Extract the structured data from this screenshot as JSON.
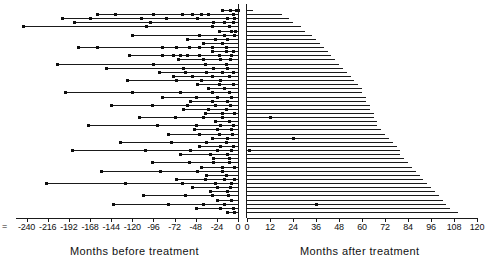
{
  "axes": {
    "left": {
      "title": "Months before treatment",
      "ticks": [
        -240,
        -216,
        -192,
        -168,
        -144,
        -120,
        -96,
        -72,
        -48,
        -24,
        0
      ],
      "tick_labels": [
        "-240",
        "-216",
        "-192",
        "-168",
        "-144",
        "-120",
        "-96",
        "-72",
        "-48",
        "-24",
        "0"
      ],
      "range": [
        -252,
        0
      ],
      "prefix_mark": "="
    },
    "right": {
      "title": "Months after treatment",
      "ticks": [
        0,
        12,
        24,
        36,
        48,
        60,
        72,
        84,
        96,
        108,
        120
      ],
      "tick_labels": [
        "0",
        "12",
        "24",
        "36",
        "48",
        "60",
        "72",
        "84",
        "96",
        "108",
        "120"
      ],
      "range": [
        0,
        120
      ]
    }
  },
  "style": {
    "line_color": "#1a1a1a",
    "marker_color": "#0d0d0d",
    "background": "#ffffff"
  },
  "chart_data": {
    "type": "scatter",
    "title": "",
    "xlabel": "Months before treatment / Months after treatment",
    "ylabel": "",
    "grid": false,
    "legend": null,
    "left_xlim": [
      -252,
      0
    ],
    "right_xlim": [
      0,
      120
    ],
    "n_rows": 50,
    "rows": [
      {
        "start": -18,
        "events": [
          -18,
          -9,
          -2,
          0
        ],
        "after": 3,
        "after_events": []
      },
      {
        "start": -160,
        "events": [
          -160,
          -140,
          -96,
          -64,
          -52,
          -42,
          -34,
          -6
        ],
        "after": 18,
        "after_events": []
      },
      {
        "start": -200,
        "events": [
          -200,
          -168,
          -110,
          -82,
          -46,
          -12,
          -4
        ],
        "after": 22,
        "after_events": []
      },
      {
        "start": -186,
        "events": [
          -186,
          -100,
          -28,
          -16,
          -6
        ],
        "after": 24,
        "after_events": []
      },
      {
        "start": -244,
        "events": [
          -244,
          -104,
          -30,
          -10
        ],
        "after": 28,
        "after_events": []
      },
      {
        "start": -22,
        "events": [
          -22,
          -8,
          -3
        ],
        "after": 30,
        "after_events": []
      },
      {
        "start": -120,
        "events": [
          -120,
          -44,
          -16,
          -5
        ],
        "after": 34,
        "after_events": []
      },
      {
        "start": -58,
        "events": [
          -58,
          -26,
          -12
        ],
        "after": 36,
        "after_events": []
      },
      {
        "start": -40,
        "events": [
          -40,
          -18
        ],
        "after": 38,
        "after_events": []
      },
      {
        "start": -182,
        "events": [
          -182,
          -160,
          -86,
          -70,
          -56,
          -44,
          -30,
          -14
        ],
        "after": 40,
        "after_events": []
      },
      {
        "start": -30,
        "events": [
          -30,
          -14,
          -6
        ],
        "after": 42,
        "after_events": []
      },
      {
        "start": -124,
        "events": [
          -124,
          -86,
          -74,
          -66,
          -58,
          -44,
          -22,
          -8
        ],
        "after": 44,
        "after_events": []
      },
      {
        "start": -68,
        "events": [
          -68,
          -40,
          -20,
          -9
        ],
        "after": 46,
        "after_events": []
      },
      {
        "start": -206,
        "events": [
          -206,
          -96,
          -38,
          -14
        ],
        "after": 48,
        "after_events": []
      },
      {
        "start": -150,
        "events": [
          -150,
          -62,
          -28,
          -12
        ],
        "after": 50,
        "after_events": []
      },
      {
        "start": -90,
        "events": [
          -90,
          -60,
          -36,
          -18,
          -6
        ],
        "after": 52,
        "after_events": []
      },
      {
        "start": -74,
        "events": [
          -74,
          -52,
          -30,
          -10
        ],
        "after": 54,
        "after_events": []
      },
      {
        "start": -126,
        "events": [
          -126,
          -70,
          -42,
          -20
        ],
        "after": 56,
        "after_events": []
      },
      {
        "start": -46,
        "events": [
          -46,
          -22,
          -6
        ],
        "after": 58,
        "after_events": []
      },
      {
        "start": -34,
        "events": [
          -34,
          -16
        ],
        "after": 60,
        "after_events": []
      },
      {
        "start": -196,
        "events": [
          -196,
          -120,
          -66,
          -30,
          -10
        ],
        "after": 60,
        "after_events": []
      },
      {
        "start": -86,
        "events": [
          -86,
          -48,
          -24,
          -8
        ],
        "after": 62,
        "after_events": []
      },
      {
        "start": -54,
        "events": [
          -54,
          -30,
          -12
        ],
        "after": 62,
        "after_events": []
      },
      {
        "start": -144,
        "events": [
          -144,
          -98,
          -58,
          -26,
          -9
        ],
        "after": 64,
        "after_events": []
      },
      {
        "start": -62,
        "events": [
          -62,
          -34,
          -14
        ],
        "after": 64,
        "after_events": []
      },
      {
        "start": -38,
        "events": [
          -38,
          -18,
          -5
        ],
        "after": 66,
        "after_events": []
      },
      {
        "start": -112,
        "events": [
          -112,
          -72,
          -40,
          -18
        ],
        "after": 66,
        "after_events": [
          12
        ]
      },
      {
        "start": -26,
        "events": [
          -26,
          -10
        ],
        "after": 68,
        "after_events": []
      },
      {
        "start": -170,
        "events": [
          -170,
          -92,
          -48,
          -20,
          -6
        ],
        "after": 68,
        "after_events": []
      },
      {
        "start": -50,
        "events": [
          -50,
          -24,
          -8
        ],
        "after": 70,
        "after_events": []
      },
      {
        "start": -80,
        "events": [
          -80,
          -44,
          -22,
          -7
        ],
        "after": 72,
        "after_events": []
      },
      {
        "start": -30,
        "events": [
          -30,
          -12
        ],
        "after": 74,
        "after_events": [
          24
        ]
      },
      {
        "start": -134,
        "events": [
          -134,
          -76,
          -36,
          -14
        ],
        "after": 76,
        "after_events": []
      },
      {
        "start": -44,
        "events": [
          -44,
          -20,
          -6
        ],
        "after": 78,
        "after_events": []
      },
      {
        "start": -188,
        "events": [
          -188,
          -106,
          -54,
          -24,
          -8
        ],
        "after": 80,
        "after_events": [
          1
        ]
      },
      {
        "start": -66,
        "events": [
          -66,
          -32,
          -12
        ],
        "after": 80,
        "after_events": []
      },
      {
        "start": -28,
        "events": [
          -28,
          -10
        ],
        "after": 82,
        "after_events": []
      },
      {
        "start": -98,
        "events": [
          -98,
          -56,
          -28,
          -10
        ],
        "after": 84,
        "after_events": []
      },
      {
        "start": -42,
        "events": [
          -42,
          -18,
          -5
        ],
        "after": 86,
        "after_events": []
      },
      {
        "start": -156,
        "events": [
          -156,
          -88,
          -46,
          -18
        ],
        "after": 88,
        "after_events": []
      },
      {
        "start": -36,
        "events": [
          -36,
          -14
        ],
        "after": 90,
        "after_events": []
      },
      {
        "start": -70,
        "events": [
          -70,
          -38,
          -16,
          -5
        ],
        "after": 92,
        "after_events": []
      },
      {
        "start": -218,
        "events": [
          -218,
          -128,
          -64,
          -26,
          -8
        ],
        "after": 94,
        "after_events": []
      },
      {
        "start": -52,
        "events": [
          -52,
          -24,
          -9
        ],
        "after": 96,
        "after_events": []
      },
      {
        "start": -32,
        "events": [
          -32,
          -12
        ],
        "after": 98,
        "after_events": []
      },
      {
        "start": -108,
        "events": [
          -108,
          -60,
          -30,
          -11
        ],
        "after": 100,
        "after_events": []
      },
      {
        "start": -24,
        "events": [
          -24,
          -8
        ],
        "after": 102,
        "after_events": []
      },
      {
        "start": -142,
        "events": [
          -142,
          -80,
          -40,
          -16
        ],
        "after": 104,
        "after_events": [
          36
        ]
      },
      {
        "start": -48,
        "events": [
          -48,
          -20,
          -6
        ],
        "after": 106,
        "after_events": []
      },
      {
        "start": -12,
        "events": [
          -12,
          -4
        ],
        "after": 110,
        "after_events": []
      }
    ]
  }
}
